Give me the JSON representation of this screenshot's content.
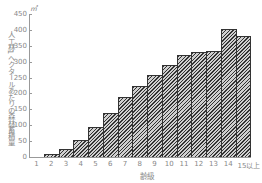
{
  "chart_data": {
    "type": "bar",
    "title": "",
    "xlabel": "齢級",
    "ylabel": "人工林1ヘクタールあたりの森林蓄積量",
    "yunit": "㎥",
    "ylim": [
      0,
      450
    ],
    "yticks": [
      0,
      50,
      100,
      150,
      200,
      250,
      300,
      350,
      400,
      450
    ],
    "categories": [
      "1",
      "2",
      "3",
      "4",
      "5",
      "6",
      "7",
      "8",
      "9",
      "10",
      "11",
      "12",
      "13",
      "14",
      "15以上"
    ],
    "values": [
      0,
      10,
      25,
      55,
      93,
      138,
      188,
      223,
      259,
      291,
      320,
      331,
      332,
      404,
      380
    ],
    "grid": false,
    "legend": "none",
    "bar_style": "diagonal hatch"
  }
}
